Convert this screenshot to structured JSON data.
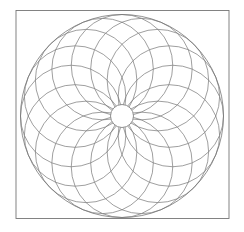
{
  "figure": {
    "background_color": "#ffffff",
    "line_color": "#757575",
    "canvas": {
      "width": 244,
      "height": 232
    },
    "frame": {
      "x": 16,
      "y": 10.5,
      "width": 213,
      "height": 208,
      "stroke_width": 0.9
    },
    "outer_circle": {
      "cx": 122,
      "cy": 116,
      "r": 101.5,
      "stroke_width": 0.8
    },
    "rosette": {
      "count": 16,
      "ring_radius": 50.75,
      "circle_radius": 50.75,
      "start_angle_deg": 90,
      "step_angle_deg": 22.5,
      "stroke_width": 0.7
    },
    "center_circle": {
      "cx": 122,
      "cy": 116,
      "r": 11.5,
      "fill": "#ffffff",
      "stroke_width": 0.8
    }
  }
}
